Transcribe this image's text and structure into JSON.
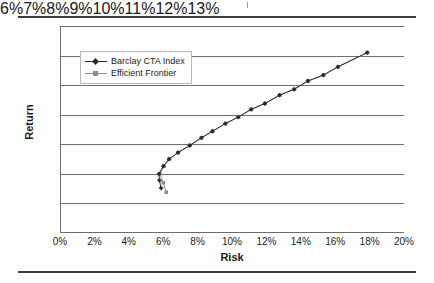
{
  "figure": {
    "has_top_rule": true,
    "has_bottom_rule": true,
    "rule_color": "#3c3c3c"
  },
  "chart_data": {
    "type": "line",
    "title": "",
    "xlabel": "Risk",
    "ylabel": "Return",
    "xlim": [
      0,
      20
    ],
    "ylim": [
      6,
      13
    ],
    "xtick_labels": [
      "0%",
      "2%",
      "4%",
      "6%",
      "8%",
      "10%",
      "12%",
      "14%",
      "16%",
      "18%",
      "20%"
    ],
    "xtick_values": [
      0,
      2,
      4,
      6,
      8,
      10,
      12,
      14,
      16,
      18,
      20
    ],
    "ytick_labels": [
      "6%",
      "7%",
      "8%",
      "9%",
      "10%",
      "11%",
      "12%",
      "13%"
    ],
    "ytick_values": [
      6,
      7,
      8,
      9,
      10,
      11,
      12,
      13
    ],
    "grid": "horizontal",
    "legend_position": "upper-left-inside",
    "series": [
      {
        "name": "Barclay CTA Index",
        "color": "#2b2b2b",
        "marker": "diamond",
        "points": [
          [
            5.82,
            7.52
          ],
          [
            5.72,
            7.78
          ],
          [
            5.7,
            8.0
          ],
          [
            5.95,
            8.26
          ],
          [
            6.28,
            8.5
          ],
          [
            6.8,
            8.72
          ],
          [
            7.48,
            8.96
          ],
          [
            8.16,
            9.22
          ],
          [
            8.8,
            9.44
          ],
          [
            9.55,
            9.7
          ],
          [
            10.3,
            9.92
          ],
          [
            11.05,
            10.18
          ],
          [
            11.85,
            10.38
          ],
          [
            12.7,
            10.66
          ],
          [
            13.55,
            10.86
          ],
          [
            14.35,
            11.14
          ],
          [
            15.25,
            11.34
          ],
          [
            16.1,
            11.62
          ],
          [
            17.8,
            12.1
          ]
        ]
      },
      {
        "name": "Efficient Frontier",
        "color": "#8e8e8e",
        "marker": "square",
        "points": [
          [
            6.12,
            7.38
          ],
          [
            5.95,
            7.7
          ],
          [
            5.74,
            8.0
          ],
          [
            5.98,
            8.26
          ],
          [
            6.3,
            8.5
          ],
          [
            6.82,
            8.72
          ],
          [
            7.5,
            8.96
          ],
          [
            8.18,
            9.22
          ],
          [
            8.82,
            9.44
          ],
          [
            9.57,
            9.7
          ],
          [
            10.32,
            9.92
          ],
          [
            11.07,
            10.18
          ],
          [
            11.87,
            10.38
          ],
          [
            12.72,
            10.66
          ],
          [
            13.57,
            10.86
          ],
          [
            14.37,
            11.14
          ],
          [
            15.27,
            11.34
          ],
          [
            16.12,
            11.62
          ],
          [
            17.82,
            12.1
          ]
        ]
      }
    ]
  }
}
